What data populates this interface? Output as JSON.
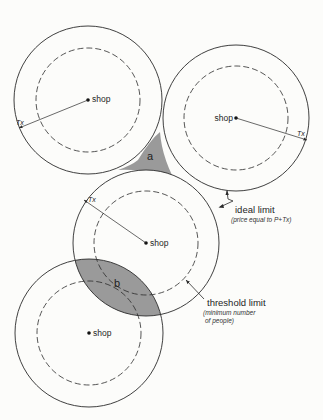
{
  "diagram": {
    "shop_label": "shop",
    "tx_label": "Tx",
    "regions": {
      "a": "a",
      "b": "b"
    },
    "ideal_limit": {
      "title": "ideal limit",
      "subtitle": "(price equal to P+Tx)"
    },
    "threshold_limit": {
      "title": "threshold limit",
      "subtitle_line1": "(minimum number",
      "subtitle_line2": "of people)"
    },
    "colors": {
      "line": "#2a2a2a",
      "shaded": "#9a9a9a",
      "background": "#fcfcfa"
    },
    "circles": [
      {
        "id": "top-left",
        "cx": 88,
        "cy": 100,
        "outer_r": 74,
        "inner_r": 52
      },
      {
        "id": "top-right",
        "cx": 236,
        "cy": 118,
        "outer_r": 73,
        "inner_r": 52
      },
      {
        "id": "middle",
        "cx": 146,
        "cy": 243,
        "outer_r": 73,
        "inner_r": 52
      },
      {
        "id": "bottom",
        "cx": 89,
        "cy": 333,
        "outer_r": 74,
        "inner_r": 52
      }
    ]
  }
}
